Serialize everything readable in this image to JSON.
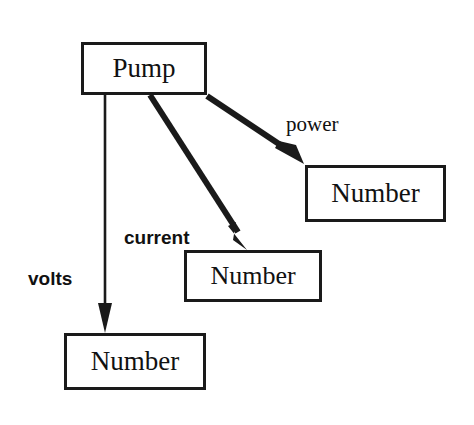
{
  "diagram": {
    "type": "object-relationship-diagram",
    "background_color": "#ffffff",
    "stroke_color": "#1a1a1a",
    "nodes": [
      {
        "id": "pump",
        "label": "Pump",
        "font": "serif"
      },
      {
        "id": "number_power",
        "label": "Number",
        "font": "serif"
      },
      {
        "id": "number_current",
        "label": "Number",
        "font": "serif"
      },
      {
        "id": "number_volts",
        "label": "Number",
        "font": "serif"
      }
    ],
    "edges": [
      {
        "id": "volts",
        "label": "volts",
        "from": "pump",
        "to": "number_volts",
        "style": "thin-line-arrow"
      },
      {
        "id": "current",
        "label": "current",
        "from": "pump",
        "to": "number_current",
        "style": "thick-line-arrow"
      },
      {
        "id": "power",
        "label": "power",
        "from": "pump",
        "to": "number_power",
        "style": "thick-line-arrow"
      }
    ]
  }
}
